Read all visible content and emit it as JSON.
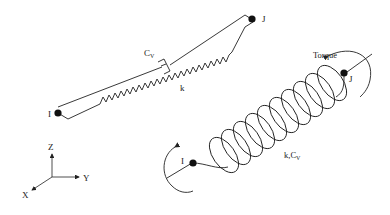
{
  "diagram": {
    "type": "spring-damper element schematic",
    "left_element": {
      "node_i_label": "I",
      "node_j_label": "J",
      "damper_label_main": "C",
      "damper_label_sub": "V",
      "spring_label": "k"
    },
    "right_element": {
      "node_i_label": "I",
      "node_j_label": "J",
      "torque_label": "Torque",
      "coil_label": "k,C",
      "coil_label_sub": "V"
    },
    "axes": {
      "z_label": "Z",
      "y_label": "Y",
      "x_label": "X"
    },
    "colors": {
      "line": "#222222",
      "node": "#111111",
      "background": "#ffffff"
    }
  }
}
